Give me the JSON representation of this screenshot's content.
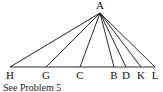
{
  "diagram": {
    "apex": {
      "label": "A",
      "x": 100,
      "y": 13
    },
    "baseline_y": 67,
    "base_points": [
      {
        "label": "H",
        "x": 10
      },
      {
        "label": "G",
        "x": 46
      },
      {
        "label": "C",
        "x": 80
      },
      {
        "label": "B",
        "x": 114
      },
      {
        "label": "D",
        "x": 126
      },
      {
        "label": "K",
        "x": 141
      },
      {
        "label": "L",
        "x": 155
      }
    ],
    "caption": "See Problem 5"
  }
}
